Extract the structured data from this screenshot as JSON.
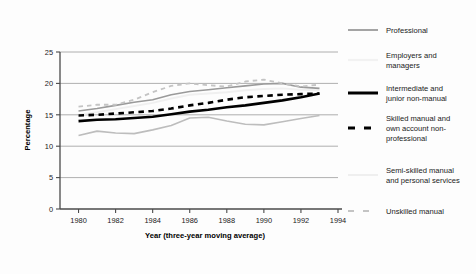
{
  "chart_data": {
    "type": "line",
    "title": "",
    "xlabel": "Year (three-year moving average)",
    "ylabel": "Percentage",
    "xlim": [
      1979,
      1994
    ],
    "ylim": [
      0,
      25
    ],
    "xticks": [
      "1980",
      "1982",
      "1984",
      "1986",
      "1988",
      "1990",
      "1992",
      "1994"
    ],
    "xtick_values": [
      1980,
      1982,
      1984,
      1986,
      1988,
      1990,
      1992,
      1994
    ],
    "yticks": [
      "0",
      "5",
      "10",
      "15",
      "20",
      "25"
    ],
    "ytick_values": [
      0,
      5,
      10,
      15,
      20,
      25
    ],
    "grid": "horizontal",
    "legend_position": "right",
    "x": [
      1980,
      1981,
      1982,
      1983,
      1984,
      1985,
      1986,
      1987,
      1988,
      1989,
      1990,
      1991,
      1992,
      1993
    ],
    "series": [
      {
        "name": "Professional",
        "style": "solid",
        "color": "#9a9a9a",
        "width": 1.6,
        "values": [
          15.6,
          16.0,
          16.5,
          17.0,
          17.4,
          18.2,
          18.7,
          19.0,
          19.3,
          19.6,
          19.9,
          20.0,
          19.4,
          19.2
        ]
      },
      {
        "name": "Employers and managers",
        "style": "solid",
        "color": "#f0f0f0",
        "width": 1.9,
        "values": [
          15.0,
          15.4,
          15.9,
          16.4,
          16.9,
          17.6,
          18.2,
          18.4,
          18.6,
          18.9,
          19.1,
          19.2,
          19.0,
          18.9
        ]
      },
      {
        "name": "Intermediate and junior non-manual",
        "style": "solid",
        "color": "#000000",
        "width": 2.6,
        "values": [
          14.0,
          14.2,
          14.3,
          14.5,
          14.7,
          15.1,
          15.5,
          15.8,
          16.2,
          16.5,
          16.9,
          17.3,
          17.8,
          18.4
        ]
      },
      {
        "name": "Skilled manual and own account non-professional",
        "style": "dashed",
        "color": "#000000",
        "width": 2.6,
        "values": [
          14.9,
          15.0,
          15.2,
          15.4,
          15.6,
          16.0,
          16.5,
          16.9,
          17.4,
          17.8,
          18.0,
          18.2,
          18.3,
          18.4
        ]
      },
      {
        "name": "Semi-skilled manual and personal services",
        "style": "solid",
        "color": "#bdbdbd",
        "width": 1.6,
        "values": [
          11.7,
          12.4,
          12.1,
          12.0,
          12.6,
          13.3,
          14.5,
          14.6,
          14.0,
          13.5,
          13.4,
          13.9,
          14.4,
          14.9
        ]
      },
      {
        "name": "Unskilled manual",
        "style": "dashed",
        "color": "#c4c4c4",
        "width": 1.8,
        "values": [
          16.3,
          16.6,
          16.6,
          17.4,
          18.6,
          19.6,
          20.0,
          19.7,
          19.5,
          20.3,
          20.6,
          20.0,
          19.5,
          19.8
        ]
      }
    ]
  },
  "legend": {
    "items": [
      {
        "label_line1": "Professional",
        "label_line2": "",
        "label_line3": "",
        "swatch": "solid-gray"
      },
      {
        "label_line1": "Employers and",
        "label_line2": "managers",
        "label_line3": "",
        "swatch": "solid-white"
      },
      {
        "label_line1": "Intermediate and",
        "label_line2": "junior non-manual",
        "label_line3": "",
        "swatch": "solid-black"
      },
      {
        "label_line1": "Skilled manual and",
        "label_line2": "own account non-",
        "label_line3": "professional",
        "swatch": "dashed-black"
      },
      {
        "label_line1": "Semi-skilled manual",
        "label_line2": "and personal services",
        "label_line3": "",
        "swatch": "solid-lightgray"
      },
      {
        "label_line1": "Unskilled manual",
        "label_line2": "",
        "label_line3": "",
        "swatch": "dashed-lightgray"
      }
    ]
  },
  "axes": {
    "ylabel": "Percentage",
    "xlabel": "Year (three-year moving average)"
  }
}
